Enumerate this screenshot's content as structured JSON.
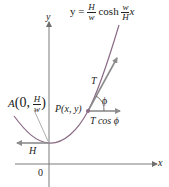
{
  "diagram": {
    "type": "catenary force diagram",
    "equation": {
      "lhs": "y =",
      "frac1_num": "H",
      "frac1_den": "w",
      "func": "cosh",
      "frac2_num": "w",
      "frac2_den": "H",
      "var": "x"
    },
    "axes": {
      "x_label": "x",
      "y_label": "y",
      "origin_label": "0"
    },
    "point_A": {
      "name": "A",
      "open": "(0,",
      "frac_num": "H",
      "frac_den": "w",
      "close": ")"
    },
    "point_P": {
      "label": "P(x, y)"
    },
    "vectors": {
      "tension": "T",
      "horizontal_component": "T cos ϕ",
      "angle": "ϕ",
      "horizontal_force": "H"
    },
    "colors": {
      "curve": "#8a6a86",
      "axes": "#7a7a7a",
      "arrows": "#8c8c8c",
      "text": "#222222"
    }
  }
}
